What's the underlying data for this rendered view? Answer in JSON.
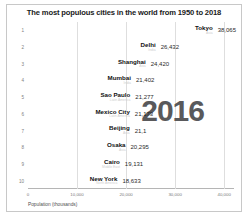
{
  "chart_data": {
    "type": "bar",
    "orientation": "horizontal",
    "title": "The most populous cities in the world from 1950 to 2018",
    "xlabel": "Population (thousands)",
    "ylabel": "",
    "xlim": [
      0,
      42000
    ],
    "xticks": [
      "0",
      "10,000",
      "20,000",
      "30,000",
      "40,000"
    ],
    "xtick_values": [
      0,
      10000,
      20000,
      30000,
      40000
    ],
    "grid": true,
    "legend": "none",
    "annotation_year": "2016",
    "categories": [
      "Tokyo",
      "Delhi",
      "Shanghai",
      "Mumbai",
      "Sao Paulo",
      "Mexico City",
      "Beijing",
      "Osaka",
      "Cairo",
      "New York"
    ],
    "values": [
      38065,
      26432,
      24420,
      21402,
      21277,
      21173,
      21140,
      20295,
      19131,
      18633
    ],
    "value_labels": [
      "38,065",
      "26,432",
      "24,420",
      "21,402",
      "21,277",
      "21,173",
      "21,1",
      "20,295",
      "19,131",
      "18,633"
    ],
    "regions": [
      "Asia",
      "India",
      "Asia",
      "India",
      "Latin America",
      "Latin America",
      "Asia",
      "Asia",
      "Middle East",
      "North America"
    ],
    "ranks": [
      "1",
      "2",
      "3",
      "4",
      "5",
      "6",
      "7",
      "8",
      "9",
      "10"
    ],
    "bar_shades": [
      "dark",
      "light",
      "dark",
      "light",
      "light",
      "light",
      "dark",
      "dark",
      "light",
      "dark"
    ]
  },
  "colors": {
    "bar_dark": "#6e6e70",
    "bar_light": "#8d8d8f",
    "year_text": "#59595b",
    "gridline": "#dedede",
    "frame": "#c8c8c8"
  }
}
